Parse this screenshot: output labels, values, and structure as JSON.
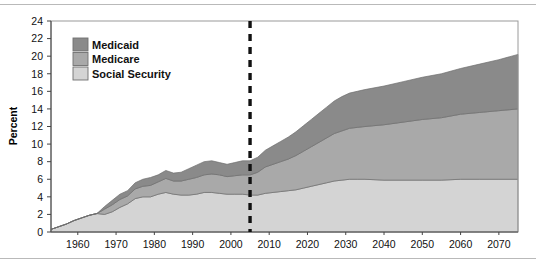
{
  "figure": {
    "ylabel": "Percent",
    "top_rule": "horizontal-rule",
    "bottom_rule": "horizontal-rule"
  },
  "legend": {
    "items": [
      {
        "label": "Medicaid",
        "color": "#8a8a8a"
      },
      {
        "label": "Medicare",
        "color": "#a9a9a9"
      },
      {
        "label": "Social Security",
        "color": "#d4d4d4"
      }
    ]
  },
  "annotation": {
    "projection_divider_year": 2005,
    "projection_divider_style": "dashed-vertical-line",
    "projection_divider_color": "#111111"
  },
  "chart_data": {
    "type": "area",
    "title": "",
    "subtitle": "",
    "xlabel": "",
    "ylabel": "Percent",
    "xlim": [
      1953,
      2075
    ],
    "ylim": [
      0,
      24
    ],
    "yticks": [
      0,
      2,
      4,
      6,
      8,
      10,
      12,
      14,
      16,
      18,
      20,
      22,
      24
    ],
    "xticks": [
      1960,
      1970,
      1980,
      1990,
      2000,
      2010,
      2020,
      2030,
      2040,
      2050,
      2060,
      2070
    ],
    "xtick_labels": [
      "1960",
      "1970",
      "1980",
      "1990",
      "2000",
      "2010",
      "2020",
      "2030",
      "2040",
      "2050",
      "2060",
      "2070"
    ],
    "ytick_labels": [
      "0",
      "2",
      "4",
      "6",
      "8",
      "10",
      "12",
      "14",
      "16",
      "18",
      "20",
      "22",
      "24"
    ],
    "grid": false,
    "stacked": true,
    "legend_position": "upper-left-inside",
    "x": [
      1953,
      1955,
      1957,
      1959,
      1961,
      1963,
      1965,
      1967,
      1969,
      1971,
      1973,
      1975,
      1977,
      1979,
      1981,
      1983,
      1985,
      1987,
      1989,
      1991,
      1993,
      1995,
      1997,
      1999,
      2001,
      2003,
      2005,
      2007,
      2009,
      2011,
      2013,
      2015,
      2017,
      2019,
      2021,
      2023,
      2025,
      2027,
      2029,
      2031,
      2033,
      2035,
      2040,
      2045,
      2050,
      2055,
      2060,
      2065,
      2070,
      2075
    ],
    "series": [
      {
        "name": "Social Security",
        "color": "#d4d4d4",
        "values": [
          0.3,
          0.6,
          0.9,
          1.3,
          1.6,
          1.9,
          2.1,
          2.0,
          2.3,
          2.8,
          3.2,
          3.8,
          4.0,
          4.0,
          4.3,
          4.5,
          4.3,
          4.2,
          4.2,
          4.3,
          4.5,
          4.5,
          4.4,
          4.3,
          4.3,
          4.3,
          4.2,
          4.2,
          4.4,
          4.5,
          4.6,
          4.7,
          4.8,
          5.0,
          5.2,
          5.4,
          5.6,
          5.8,
          5.9,
          6.0,
          6.0,
          6.0,
          5.9,
          5.9,
          5.9,
          5.9,
          6.0,
          6.0,
          6.0,
          6.0
        ]
      },
      {
        "name": "Medicare",
        "color": "#a9a9a9",
        "values": [
          0.0,
          0.0,
          0.0,
          0.0,
          0.0,
          0.0,
          0.0,
          0.6,
          0.8,
          0.9,
          0.9,
          1.1,
          1.2,
          1.3,
          1.4,
          1.6,
          1.5,
          1.6,
          1.8,
          1.9,
          2.0,
          2.1,
          2.1,
          2.0,
          2.1,
          2.2,
          2.3,
          2.6,
          3.0,
          3.2,
          3.4,
          3.6,
          3.9,
          4.2,
          4.5,
          4.8,
          5.1,
          5.4,
          5.6,
          5.8,
          5.9,
          6.0,
          6.3,
          6.6,
          6.9,
          7.1,
          7.4,
          7.6,
          7.8,
          8.0
        ]
      },
      {
        "name": "Medicaid",
        "color": "#8a8a8a",
        "values": [
          0.0,
          0.0,
          0.0,
          0.0,
          0.0,
          0.0,
          0.0,
          0.3,
          0.5,
          0.6,
          0.6,
          0.7,
          0.8,
          0.9,
          0.8,
          0.9,
          0.9,
          1.0,
          1.2,
          1.4,
          1.5,
          1.5,
          1.4,
          1.4,
          1.5,
          1.6,
          1.6,
          1.7,
          1.9,
          2.1,
          2.3,
          2.5,
          2.7,
          2.9,
          3.1,
          3.3,
          3.5,
          3.7,
          3.9,
          4.0,
          4.1,
          4.2,
          4.4,
          4.6,
          4.8,
          5.0,
          5.2,
          5.5,
          5.8,
          6.2
        ]
      }
    ],
    "series_order_bottom_to_top": [
      "Social Security",
      "Medicare",
      "Medicaid"
    ]
  }
}
